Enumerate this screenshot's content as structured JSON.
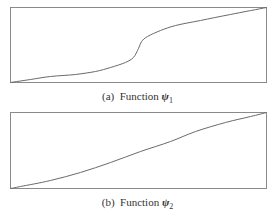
{
  "colors": {
    "frame": "#8a8a8a",
    "line": "#6a6a6a",
    "text": "#333333"
  },
  "panels": [
    {
      "label": "(a)",
      "caption_word": "Function",
      "symbol": "ψ",
      "subscript": "1"
    },
    {
      "label": "(b)",
      "caption_word": "Function",
      "symbol": "ψ",
      "subscript": "2"
    }
  ],
  "chart_data": [
    {
      "type": "line",
      "title": "(a) Function ψ1",
      "xlabel": "",
      "ylabel": "",
      "xlim": [
        0,
        1
      ],
      "ylim": [
        0,
        1
      ],
      "grid": false,
      "axes_ticks": false,
      "x": [
        0.0,
        0.078,
        0.156,
        0.254,
        0.332,
        0.391,
        0.449,
        0.48,
        0.5,
        0.512,
        0.535,
        0.586,
        0.645,
        0.742,
        0.859,
        1.0
      ],
      "y": [
        0.0,
        0.04,
        0.08,
        0.107,
        0.147,
        0.2,
        0.267,
        0.333,
        0.453,
        0.547,
        0.613,
        0.693,
        0.76,
        0.827,
        0.907,
        1.0
      ]
    },
    {
      "type": "line",
      "title": "(b) Function ψ2",
      "xlabel": "",
      "ylabel": "",
      "xlim": [
        0,
        1
      ],
      "ylim": [
        0,
        1
      ],
      "grid": false,
      "axes_ticks": false,
      "x": [
        0.0,
        0.039,
        0.156,
        0.273,
        0.391,
        0.508,
        0.625,
        0.723,
        0.84,
        0.938,
        1.0
      ],
      "y": [
        0.0,
        0.026,
        0.105,
        0.211,
        0.342,
        0.487,
        0.618,
        0.75,
        0.868,
        0.947,
        1.0
      ]
    }
  ]
}
